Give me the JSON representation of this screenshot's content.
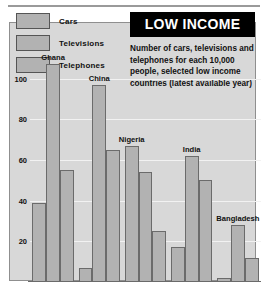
{
  "header": {
    "rule": "divider"
  },
  "title": {
    "banner": "LOW INCOME",
    "description": "Number of cars, televisions and telephones for each 10,000 people, selected low income countries (latest available year)"
  },
  "legend": {
    "items": [
      {
        "label": "Cars",
        "key": "cars",
        "swatch": "#b2b2b2"
      },
      {
        "label": "Televisions",
        "key": "televisions",
        "swatch": "#b2b2b2"
      },
      {
        "label": "Telephones",
        "key": "telephones",
        "swatch": "#b2b2b2"
      }
    ]
  },
  "axis": {
    "ticks": [
      "100",
      "80",
      "60",
      "40",
      "20"
    ],
    "tick_values": [
      100,
      80,
      60,
      40,
      20
    ]
  },
  "chart_data": {
    "type": "bar",
    "title": "LOW INCOME",
    "subtitle": "Number of cars, televisions and telephones for each 10,000 people, selected low income countries (latest available year)",
    "xlabel": "",
    "ylabel": "",
    "ylim": [
      0,
      115
    ],
    "yticks": [
      20,
      40,
      60,
      80,
      100
    ],
    "grid": true,
    "legend_position": "top-left",
    "categories": [
      "Ghana",
      "China",
      "Nigeria",
      "India",
      "Bangladesh"
    ],
    "series": [
      {
        "name": "Cars",
        "values": [
          39,
          7,
          67,
          17,
          2
        ]
      },
      {
        "name": "Televisions",
        "values": [
          107,
          97,
          54,
          62,
          28
        ]
      },
      {
        "name": "Telephones",
        "values": [
          55,
          65,
          25,
          50,
          12
        ]
      }
    ]
  },
  "colors": {
    "bar_fill": "#b2b2b2",
    "bar_stroke": "#6b6b6b",
    "plot_background": "#d8d8d8",
    "gridline": "#f2f2f2",
    "banner_background": "#000000",
    "banner_text": "#ffffff"
  }
}
